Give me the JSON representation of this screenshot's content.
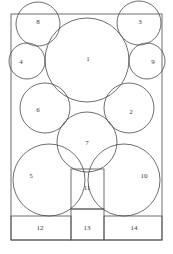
{
  "figure": {
    "stroke_color": "#4a4a4a",
    "label_color": "#3a3a3a",
    "background_color": "#ffffff",
    "container": {
      "x": 11,
      "y": 14,
      "width": 151,
      "height": 226
    }
  },
  "chart_data": {
    "type": "diagram",
    "subtype": "circle-packing",
    "xlabel": "",
    "ylabel": "",
    "grid": false,
    "legend": "none",
    "container": {
      "x": 11,
      "y": 14,
      "width": 151,
      "height": 226
    },
    "circles": [
      {
        "label": "1",
        "cx": 87,
        "cy": 60,
        "r": 42
      },
      {
        "label": "2",
        "cx": 129,
        "cy": 108,
        "r": 25
      },
      {
        "label": "3",
        "cx": 139,
        "cy": 23,
        "r": 22
      },
      {
        "label": "4",
        "cx": 27,
        "cy": 61,
        "r": 18
      },
      {
        "label": "5",
        "cx": 49,
        "cy": 180,
        "r": 36
      },
      {
        "label": "6",
        "cx": 45,
        "cy": 108,
        "r": 25
      },
      {
        "label": "7",
        "cx": 87,
        "cy": 142,
        "r": 30
      },
      {
        "label": "8",
        "cx": 38,
        "cy": 24,
        "r": 22
      },
      {
        "label": "9",
        "cx": 147,
        "cy": 61,
        "r": 18
      },
      {
        "label": "10",
        "cx": 124,
        "cy": 180,
        "r": 36
      }
    ],
    "rectangles": [
      {
        "label": "11",
        "x": 71,
        "y": 169,
        "width": 33,
        "height": 40
      },
      {
        "label": "12",
        "x": 11,
        "y": 216,
        "width": 60,
        "height": 24
      },
      {
        "label": "13",
        "x": 71,
        "y": 209,
        "width": 33,
        "height": 31
      },
      {
        "label": "14",
        "x": 104,
        "y": 216,
        "width": 58,
        "height": 24
      }
    ],
    "labels": [
      {
        "text": "1",
        "x": 88,
        "y": 59
      },
      {
        "text": "2",
        "x": 131,
        "y": 112
      },
      {
        "text": "3",
        "x": 140,
        "y": 22
      },
      {
        "text": "4",
        "x": 21,
        "y": 62
      },
      {
        "text": "5",
        "x": 31,
        "y": 176
      },
      {
        "text": "6",
        "x": 38,
        "y": 110
      },
      {
        "text": "7",
        "x": 87,
        "y": 143
      },
      {
        "text": "8",
        "x": 38,
        "y": 22
      },
      {
        "text": "9",
        "x": 153,
        "y": 62
      },
      {
        "text": "10",
        "x": 144,
        "y": 176
      },
      {
        "text": "11",
        "x": 87,
        "y": 188
      },
      {
        "text": "12",
        "x": 40,
        "y": 228
      },
      {
        "text": "13",
        "x": 87,
        "y": 228
      },
      {
        "text": "14",
        "x": 134,
        "y": 228
      }
    ]
  }
}
